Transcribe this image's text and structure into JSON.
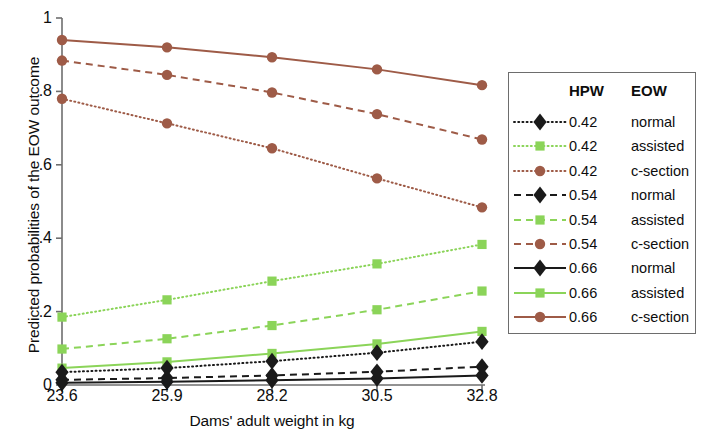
{
  "chart_data": {
    "type": "line",
    "title": "",
    "xlabel": "Dams' adult weight in kg",
    "ylabel": "Predicted probabilities of the EOW outcome",
    "x": [
      23.6,
      25.9,
      28.2,
      30.5,
      32.8
    ],
    "xtick_labels": [
      "23.6",
      "25.9",
      "28.2",
      "30.5",
      "32.8"
    ],
    "ytick_labels": [
      "0",
      ".2",
      ".4",
      ".6",
      ".8",
      "1"
    ],
    "ytick_values": [
      0,
      0.2,
      0.4,
      0.6,
      0.8,
      1
    ],
    "xlim": [
      23.6,
      32.8
    ],
    "ylim": [
      0,
      1
    ],
    "grid": false,
    "legend_position": "right",
    "legend_headers": [
      "HPW",
      "EOW"
    ],
    "series": [
      {
        "name": "0.42 normal",
        "hpw": "0.42",
        "eow": "normal",
        "color": "#1a1a1a",
        "marker": "diamond",
        "dash": "dotted",
        "values": [
          0.035,
          0.046,
          0.065,
          0.088,
          0.118
        ]
      },
      {
        "name": "0.42 assisted",
        "hpw": "0.42",
        "eow": "assisted",
        "color": "#8BD459",
        "marker": "square",
        "dash": "dotted",
        "values": [
          0.185,
          0.232,
          0.283,
          0.33,
          0.383
        ]
      },
      {
        "name": "0.42 c-section",
        "hpw": "0.42",
        "eow": "c-section",
        "color": "#9E5B47",
        "marker": "circle",
        "dash": "dotted",
        "values": [
          0.78,
          0.713,
          0.645,
          0.563,
          0.484
        ]
      },
      {
        "name": "0.54 normal",
        "hpw": "0.54",
        "eow": "normal",
        "color": "#1a1a1a",
        "marker": "diamond",
        "dash": "dashed",
        "values": [
          0.014,
          0.019,
          0.026,
          0.036,
          0.05
        ]
      },
      {
        "name": "0.54 assisted",
        "hpw": "0.54",
        "eow": "assisted",
        "color": "#8BD459",
        "marker": "square",
        "dash": "dashed",
        "values": [
          0.098,
          0.126,
          0.162,
          0.205,
          0.256
        ]
      },
      {
        "name": "0.54 c-section",
        "hpw": "0.54",
        "eow": "c-section",
        "color": "#9E5B47",
        "marker": "circle",
        "dash": "dashed",
        "values": [
          0.884,
          0.845,
          0.797,
          0.738,
          0.669
        ]
      },
      {
        "name": "0.66 normal",
        "hpw": "0.66",
        "eow": "normal",
        "color": "#1a1a1a",
        "marker": "diamond",
        "dash": "solid",
        "values": [
          0.006,
          0.009,
          0.013,
          0.018,
          0.026
        ]
      },
      {
        "name": "0.66 assisted",
        "hpw": "0.66",
        "eow": "assisted",
        "color": "#8BD459",
        "marker": "square",
        "dash": "solid",
        "values": [
          0.046,
          0.063,
          0.086,
          0.112,
          0.146
        ]
      },
      {
        "name": "0.66 c-section",
        "hpw": "0.66",
        "eow": "c-section",
        "color": "#9E5B47",
        "marker": "circle",
        "dash": "solid",
        "values": [
          0.94,
          0.92,
          0.893,
          0.86,
          0.817
        ]
      }
    ]
  }
}
